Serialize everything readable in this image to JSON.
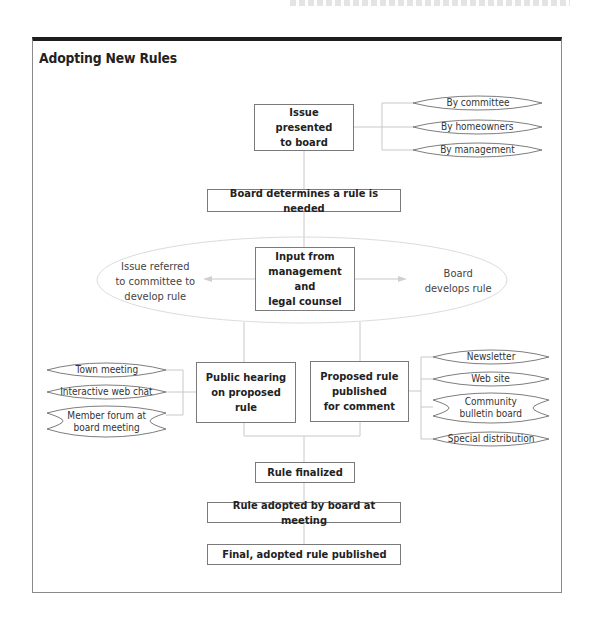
{
  "title": "Adopting New Rules",
  "colors": {
    "frame_top": "#1e1e1e",
    "box_border": "#7a7a7a",
    "connector": "#c8c8c8",
    "text": "#222222"
  },
  "flow": {
    "issue_presented": "Issue presented\nto board",
    "sources": [
      "By committee",
      "By homeowners",
      "By management"
    ],
    "board_determines": "Board determines a rule is needed",
    "input": "Input from\nmanagement and\nlegal counsel",
    "left_option": "Issue referred\nto committee to\ndevelop rule",
    "right_option": "Board\ndevelops rule",
    "public_hearing": "Public hearing\non proposed rule",
    "hearing_formats": [
      "Town meeting",
      "Interactive web chat",
      "Member forum at\nboard meeting"
    ],
    "proposed_published": "Proposed rule\npublished\nfor comment",
    "publish_channels": [
      "Newsletter",
      "Web site",
      "Community\nbulletin board",
      "Special distribution"
    ],
    "rule_finalized": "Rule finalized",
    "rule_adopted": "Rule adopted by board at meeting",
    "final_published": "Final, adopted rule published"
  }
}
